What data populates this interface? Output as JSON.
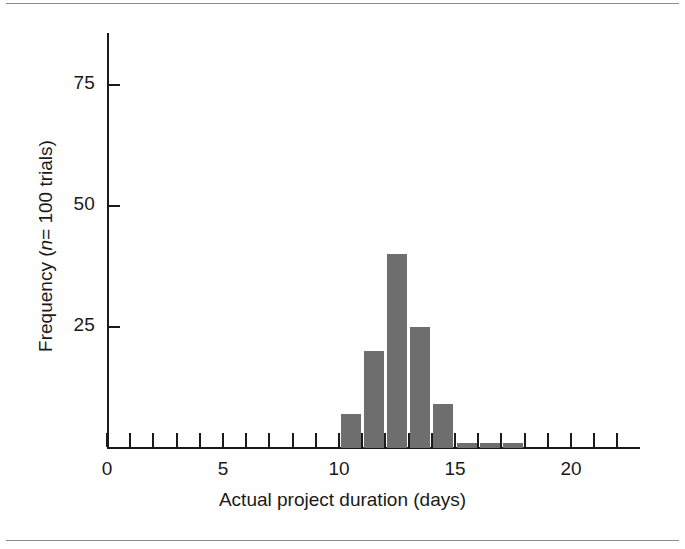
{
  "figure": {
    "kind": "histogram-figure",
    "background": "#ffffff",
    "rule_color": "#8a8a8a",
    "has_top_rule": true,
    "has_bottom_rule": true
  },
  "axes": {
    "x_title": "Actual project duration (days)",
    "y_title_prefix": "Frequency (",
    "y_title_italic": "n",
    "y_title_suffix": "= 100 trials)",
    "y_title_plain": "Frequency (n= 100 trials)",
    "x_tick_labels": [
      "0",
      "5",
      "10",
      "15",
      "20"
    ],
    "y_tick_labels": [
      "25",
      "50",
      "75"
    ],
    "axis_color": "#1a1a1a"
  },
  "chart_data": {
    "type": "bar",
    "title": "",
    "subtitle": "",
    "xlabel": "Actual project duration (days)",
    "ylabel": "Frequency (n= 100 trials)",
    "xlim": [
      0,
      23
    ],
    "ylim": [
      0,
      85
    ],
    "xticks": [
      0,
      1,
      2,
      3,
      4,
      5,
      6,
      7,
      8,
      9,
      10,
      11,
      12,
      13,
      14,
      15,
      16,
      17,
      18,
      19,
      20,
      21,
      22
    ],
    "xticklabels_major": {
      "0": "0",
      "5": "5",
      "10": "10",
      "15": "15",
      "20": "20"
    },
    "yticks": [
      25,
      50,
      75
    ],
    "grid": false,
    "legend": false,
    "bar_color": "#6e6e6e",
    "bin_width": 1,
    "categories": [
      10,
      11,
      12,
      13,
      14,
      15,
      16,
      17
    ],
    "values": [
      7,
      20,
      40,
      25,
      9,
      1,
      1,
      1
    ],
    "bins": [
      {
        "bin_start": 10,
        "bin_end": 11,
        "value": 7
      },
      {
        "bin_start": 11,
        "bin_end": 12,
        "value": 20
      },
      {
        "bin_start": 12,
        "bin_end": 13,
        "value": 40
      },
      {
        "bin_start": 13,
        "bin_end": 14,
        "value": 25
      },
      {
        "bin_start": 14,
        "bin_end": 15,
        "value": 9
      },
      {
        "bin_start": 15,
        "bin_end": 16,
        "value": 1
      },
      {
        "bin_start": 16,
        "bin_end": 17,
        "value": 1
      },
      {
        "bin_start": 17,
        "bin_end": 18,
        "value": 1
      }
    ]
  }
}
